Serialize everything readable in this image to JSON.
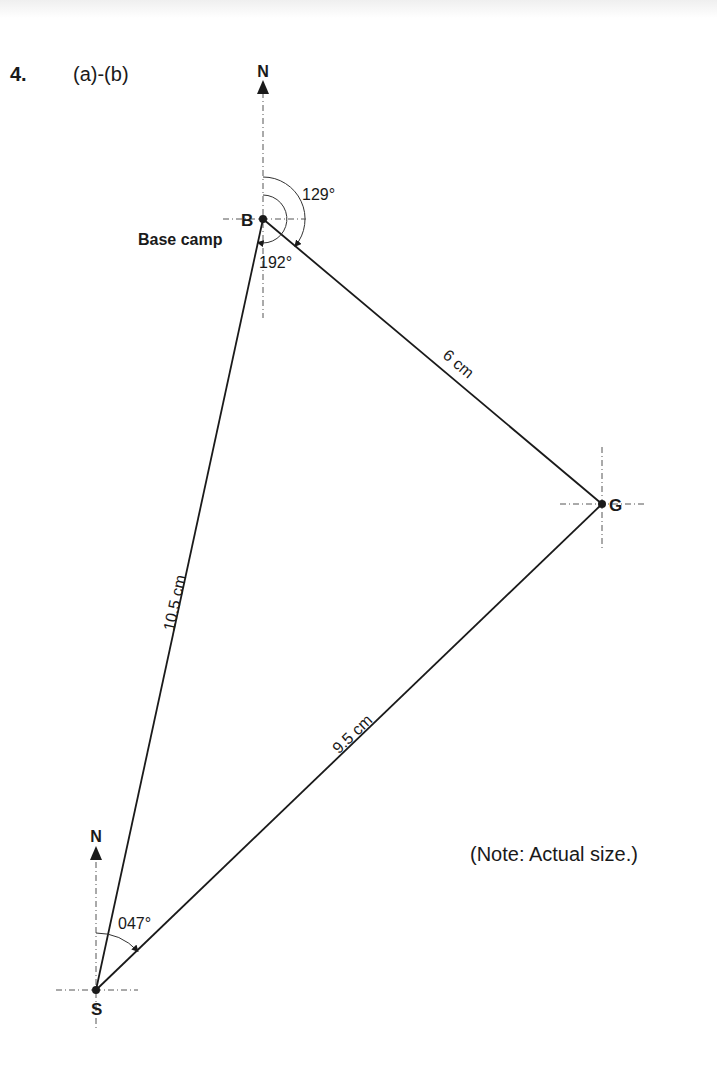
{
  "question": {
    "number": "4.",
    "parts": "(a)-(b)"
  },
  "note": "(Note: Actual size.)",
  "north_label": "N",
  "points": {
    "B": {
      "label": "B",
      "description": "Base camp"
    },
    "G": {
      "label": "G"
    },
    "S": {
      "label": "S"
    }
  },
  "segments": {
    "BG": {
      "label": "6 cm"
    },
    "SB": {
      "label": "10.5 cm"
    },
    "SG": {
      "label": "9.5 cm"
    }
  },
  "bearings": {
    "B_to_G": "129°",
    "B_to_S": "192°",
    "S_to_G": "047°"
  },
  "colors": {
    "ink": "#1a1a1a",
    "background": "#ffffff"
  }
}
